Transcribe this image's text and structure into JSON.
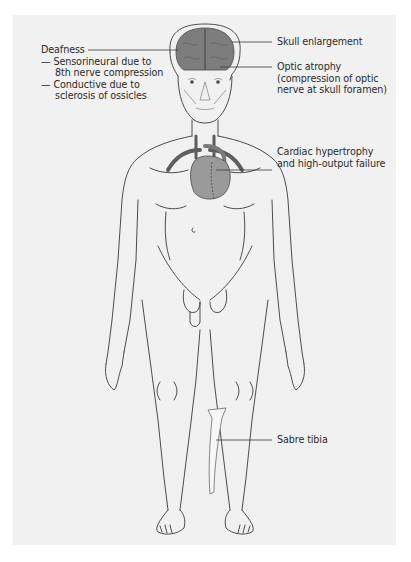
{
  "figure": {
    "background_color": "#f1f1f1",
    "outline_color": "#3a3a3a",
    "brain_color": "#7d7d7d",
    "heart_color": "#9a9a9a",
    "vessel_color": "#5e5e5e"
  },
  "labels": {
    "deafness": {
      "title": "Deafness",
      "items": [
        {
          "dash": "—",
          "line1": "Sensorineural due to",
          "line2": "8th nerve compression"
        },
        {
          "dash": "—",
          "line1": "Conductive due to",
          "line2": "sclerosis of ossicles"
        }
      ]
    },
    "skull": {
      "line1": "Skull enlargement"
    },
    "optic": {
      "line1": "Optic atrophy",
      "line2": "(compression of optic",
      "line3": "nerve at skull foramen)"
    },
    "cardiac": {
      "line1": "Cardiac hypertrophy",
      "line2": "and high-output failure"
    },
    "tibia": {
      "line1": "Sabre tibia"
    }
  }
}
